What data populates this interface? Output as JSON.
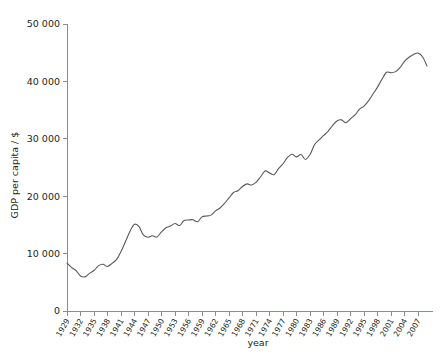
{
  "chart_data": {
    "type": "line",
    "title": "",
    "xlabel": "year",
    "ylabel": "GDP per capita / $",
    "xlim": [
      1929,
      2009
    ],
    "ylim": [
      0,
      50000
    ],
    "grid": false,
    "legend": false,
    "y_ticks": [
      0,
      10000,
      20000,
      30000,
      40000,
      50000
    ],
    "y_ticklabels": [
      "0",
      "10 000",
      "20 000",
      "30 000",
      "40 000",
      "50 000"
    ],
    "x_ticks": [
      1929,
      1932,
      1935,
      1938,
      1941,
      1944,
      1947,
      1950,
      1953,
      1956,
      1959,
      1962,
      1965,
      1968,
      1971,
      1974,
      1977,
      1980,
      1983,
      1986,
      1989,
      1992,
      1995,
      1998,
      2001,
      2004,
      2007
    ],
    "x_ticklabels": [
      "1929",
      "1932",
      "1935",
      "1938",
      "1941",
      "1944",
      "1947",
      "1950",
      "1953",
      "1956",
      "1959",
      "1962",
      "1965",
      "1968",
      "1971",
      "1974",
      "1977",
      "1980",
      "1983",
      "1986",
      "1989",
      "1992",
      "1995",
      "1998",
      "2001",
      "2004",
      "2007"
    ],
    "line_color": "#59595b",
    "series": [
      {
        "name": "GDP per capita",
        "x": [
          1929,
          1930,
          1931,
          1932,
          1933,
          1934,
          1935,
          1936,
          1937,
          1938,
          1939,
          1940,
          1941,
          1942,
          1943,
          1944,
          1945,
          1946,
          1947,
          1948,
          1949,
          1950,
          1951,
          1952,
          1953,
          1954,
          1955,
          1956,
          1957,
          1958,
          1959,
          1960,
          1961,
          1962,
          1963,
          1964,
          1965,
          1966,
          1967,
          1968,
          1969,
          1970,
          1971,
          1972,
          1973,
          1974,
          1975,
          1976,
          1977,
          1978,
          1979,
          1980,
          1981,
          1982,
          1983,
          1984,
          1985,
          1986,
          1987,
          1988,
          1989,
          1990,
          1991,
          1992,
          1993,
          1994,
          1995,
          1996,
          1997,
          1998,
          1999,
          2000,
          2001,
          2002,
          2003,
          2004,
          2005,
          2006,
          2007,
          2008,
          2009
        ],
        "values": [
          8350,
          7600,
          7050,
          6100,
          5950,
          6550,
          7050,
          7900,
          8150,
          7750,
          8300,
          8950,
          10350,
          12100,
          13900,
          15100,
          14700,
          13200,
          12850,
          13100,
          12900,
          13800,
          14500,
          14800,
          15250,
          14900,
          15750,
          15850,
          15900,
          15550,
          16400,
          16550,
          16700,
          17450,
          17950,
          18750,
          19700,
          20650,
          20950,
          21700,
          22150,
          21950,
          22400,
          23350,
          24400,
          24050,
          23750,
          24800,
          25650,
          26750,
          27300,
          26850,
          27250,
          26400,
          27250,
          28950,
          29800,
          30550,
          31300,
          32300,
          33100,
          33300,
          32800,
          33500,
          34150,
          35150,
          35700,
          36600,
          37800,
          39000,
          40400,
          41600,
          41500,
          41700,
          42400,
          43500,
          44200,
          44700,
          44950,
          44300,
          42700
        ]
      }
    ]
  }
}
